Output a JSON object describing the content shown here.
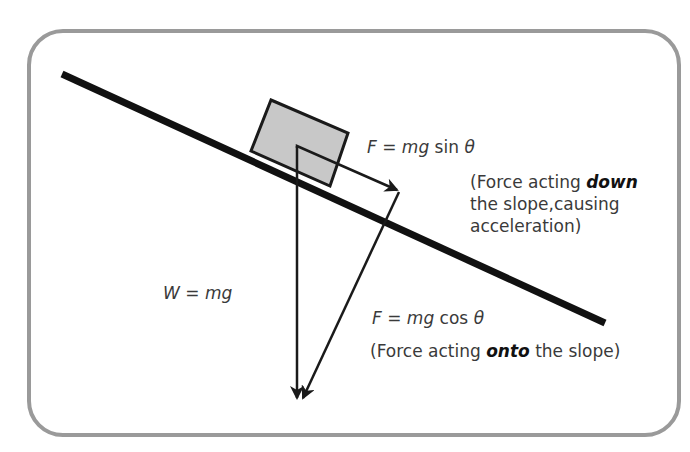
{
  "diagram": {
    "colors": {
      "frame": "#9a9a9a",
      "slope": "#111111",
      "block_fill": "#c8c8c8",
      "arrows": "#1a1a1a",
      "text": "#3a3a3a"
    },
    "labels": {
      "weight": {
        "lhs": "W",
        "eq": " = ",
        "rhs": "mg"
      },
      "sin_force": {
        "lhs": "F",
        "eq": " = ",
        "mg": "mg",
        "func": " sin ",
        "theta": "θ"
      },
      "sin_note": {
        "pre": "(Force acting ",
        "emph": "down",
        "line2": "the slope,causing",
        "line3": "acceleration)"
      },
      "cos_force": {
        "lhs": "F",
        "eq": " = ",
        "mg": "mg",
        "func": " cos ",
        "theta": "θ"
      },
      "cos_note": {
        "pre": "(Force acting ",
        "emph": "onto",
        "post": " the slope)"
      }
    }
  }
}
